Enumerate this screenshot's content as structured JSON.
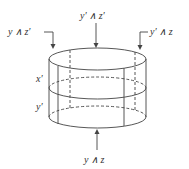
{
  "diagram": {
    "type": "cylinder-lattice",
    "labels": {
      "top_left": "y ∧ z′",
      "top_center": "y′ ∧ z′",
      "top_right": "y′ ∧ z",
      "side_upper": "x′",
      "side_lower": "y′",
      "bottom": "y ∧ z"
    },
    "colors": {
      "stroke": "#444444",
      "text": "#333333",
      "background": "#ffffff"
    }
  }
}
